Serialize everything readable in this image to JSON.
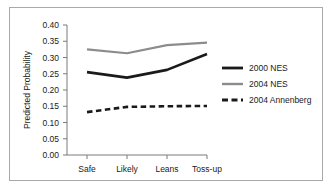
{
  "chart_data": {
    "type": "line",
    "title": "",
    "xlabel": "",
    "ylabel": "Predicted Probability",
    "categories": [
      "Safe",
      "Likely",
      "Leans",
      "Toss-up"
    ],
    "ylim": [
      0.0,
      0.4
    ],
    "yticks": [
      "0.00",
      "0.05",
      "0.10",
      "0.15",
      "0.20",
      "0.25",
      "0.30",
      "0.35",
      "0.40"
    ],
    "ytick_values": [
      0.0,
      0.05,
      0.1,
      0.15,
      0.2,
      0.25,
      0.3,
      0.35,
      0.4
    ],
    "grid": false,
    "legend_position": "right",
    "series": [
      {
        "name": "2000 NES",
        "values": [
          0.255,
          0.238,
          0.262,
          0.311
        ],
        "color": "#1a1a1a",
        "style": "solid",
        "width": 2.6
      },
      {
        "name": "2004 NES",
        "values": [
          0.325,
          0.313,
          0.338,
          0.346
        ],
        "color": "#8c8c8c",
        "style": "solid",
        "width": 2.2
      },
      {
        "name": "2004 Annenberg",
        "values": [
          0.132,
          0.148,
          0.15,
          0.151
        ],
        "color": "#1a1a1a",
        "style": "dashed",
        "width": 2.6
      }
    ]
  },
  "axis": {
    "axis_color": "#7a7a7a",
    "border_color": "#a9a9a9"
  }
}
